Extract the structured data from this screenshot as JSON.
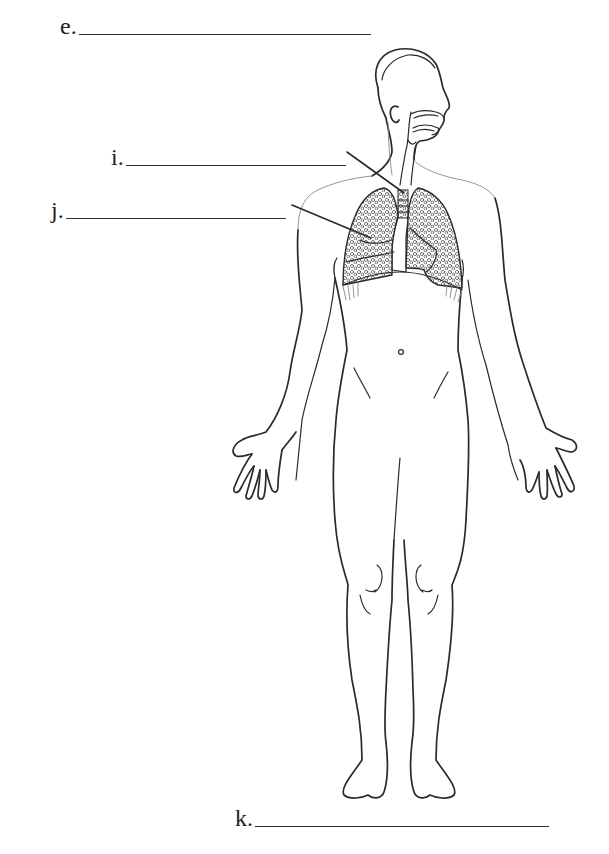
{
  "worksheet": {
    "labels": [
      {
        "id": "e",
        "text": "e.",
        "x": 60,
        "y": 22,
        "blank_width": 292
      },
      {
        "id": "i",
        "text": "i.",
        "x": 111,
        "y": 150,
        "blank_width": 220
      },
      {
        "id": "j",
        "text": "j.",
        "x": 51,
        "y": 204,
        "blank_width": 220
      },
      {
        "id": "k",
        "text": "k.",
        "x": 235,
        "y": 811,
        "blank_width": 295
      }
    ],
    "pointers": [
      {
        "for": "i",
        "x1": 347,
        "y1": 152,
        "x2": 404,
        "y2": 193
      },
      {
        "for": "j",
        "x1": 292,
        "y1": 205,
        "x2": 371,
        "y2": 238
      }
    ]
  },
  "diagram": {
    "structures": [
      "head",
      "nasal-cavity",
      "oral-cavity",
      "pharynx",
      "larynx",
      "trachea",
      "right-lung",
      "left-lung",
      "diaphragm",
      "torso",
      "arms",
      "hands",
      "legs",
      "feet"
    ],
    "colors": {
      "line": "#2a2a2a",
      "background": "#ffffff",
      "lung_texture": "#6a6a6a"
    }
  }
}
